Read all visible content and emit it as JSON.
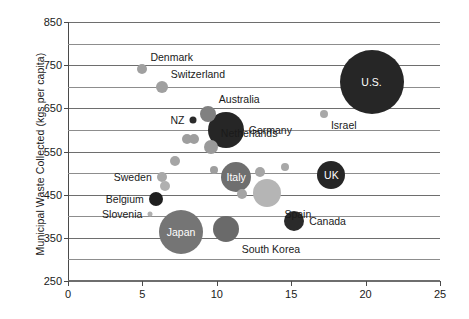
{
  "chart_data": {
    "type": "scatter",
    "title": "",
    "xlabel": "",
    "ylabel": "Municipal Waste Collected (kgs per capita)",
    "xlim": [
      0,
      25
    ],
    "ylim": [
      250,
      850
    ],
    "xticks": [
      0,
      5,
      10,
      15,
      20,
      25
    ],
    "yticks": [
      250,
      350,
      450,
      550,
      650,
      750,
      850
    ],
    "y_minor_step": 50,
    "grid": "horizontal",
    "legend": "none",
    "size_encoding": "bubble area (population / total waste)",
    "points": [
      {
        "label": "Denmark",
        "x": 5.0,
        "y": 740,
        "r": 5,
        "color": "#a0a0a0",
        "label_pos": "above-right",
        "label_inside": false
      },
      {
        "label": "Switzerland",
        "x": 6.3,
        "y": 700,
        "r": 6,
        "color": "#a0a0a0",
        "label_pos": "above-right",
        "label_inside": false
      },
      {
        "label": "Australia",
        "x": 9.4,
        "y": 637,
        "r": 8,
        "color": "#808080",
        "label_pos": "above-right",
        "label_inside": false
      },
      {
        "label": "NZ",
        "x": 8.4,
        "y": 622,
        "r": 3.5,
        "color": "#2a2a2a",
        "label_pos": "left",
        "label_inside": false
      },
      {
        "label": "Germany",
        "x": 10.6,
        "y": 600,
        "r": 18,
        "color": "#262626",
        "label_pos": "right",
        "label_inside": false
      },
      {
        "label": "Netherlands",
        "x": 9.6,
        "y": 560,
        "r": 7,
        "color": "#9a9a9a",
        "label_pos": "above-right",
        "label_inside": false
      },
      {
        "label": "Italy",
        "x": 11.3,
        "y": 492,
        "r": 15,
        "color": "#6f6f6f",
        "label_pos": "inside",
        "label_inside": true
      },
      {
        "label": "UK",
        "x": 17.7,
        "y": 495,
        "r": 14,
        "color": "#262626",
        "label_pos": "inside",
        "label_inside": true
      },
      {
        "label": "Sweden",
        "x": 6.3,
        "y": 492,
        "r": 5,
        "color": "#a8a8a8",
        "label_pos": "left",
        "label_inside": false
      },
      {
        "label": "Belgium",
        "x": 5.9,
        "y": 440,
        "r": 7,
        "color": "#1f1f1f",
        "label_pos": "left",
        "label_inside": false
      },
      {
        "label": "Slovenia",
        "x": 5.5,
        "y": 405,
        "r": 2.5,
        "color": "#b0b0b0",
        "label_pos": "left",
        "label_inside": false
      },
      {
        "label": "Spain",
        "x": 13.4,
        "y": 455,
        "r": 14,
        "color": "#b5b5b5",
        "label_pos": "below-right",
        "label_inside": false
      },
      {
        "label": "Canada",
        "x": 15.2,
        "y": 390,
        "r": 10,
        "color": "#2a2a2a",
        "label_pos": "right",
        "label_inside": false
      },
      {
        "label": "Japan",
        "x": 7.6,
        "y": 363,
        "r": 22,
        "color": "#757575",
        "label_pos": "inside",
        "label_inside": true
      },
      {
        "label": "South Korea",
        "x": 10.6,
        "y": 370,
        "r": 13,
        "color": "#6a6a6a",
        "label_pos": "below-right",
        "label_inside": false
      },
      {
        "label": "Israel",
        "x": 17.2,
        "y": 638,
        "r": 4,
        "color": "#a8a8a8",
        "label_pos": "below-right",
        "label_inside": false
      },
      {
        "label": "U.S.",
        "x": 20.4,
        "y": 712,
        "r": 32,
        "color": "#262626",
        "label_pos": "inside",
        "label_inside": true
      },
      {
        "label": "",
        "x": 8.0,
        "y": 578,
        "r": 5,
        "color": "#9e9e9e",
        "label_pos": "none",
        "label_inside": false
      },
      {
        "label": "",
        "x": 8.5,
        "y": 578,
        "r": 5,
        "color": "#9e9e9e",
        "label_pos": "none",
        "label_inside": false
      },
      {
        "label": "",
        "x": 7.2,
        "y": 528,
        "r": 5,
        "color": "#a5a5a5",
        "label_pos": "none",
        "label_inside": false
      },
      {
        "label": "",
        "x": 9.8,
        "y": 508,
        "r": 4,
        "color": "#9e9e9e",
        "label_pos": "none",
        "label_inside": false
      },
      {
        "label": "",
        "x": 12.9,
        "y": 502,
        "r": 5,
        "color": "#a5a5a5",
        "label_pos": "none",
        "label_inside": false
      },
      {
        "label": "",
        "x": 6.5,
        "y": 470,
        "r": 5,
        "color": "#b0b0b0",
        "label_pos": "none",
        "label_inside": false
      },
      {
        "label": "",
        "x": 11.7,
        "y": 452,
        "r": 5,
        "color": "#a5a5a5",
        "label_pos": "none",
        "label_inside": false
      },
      {
        "label": "",
        "x": 14.6,
        "y": 515,
        "r": 4,
        "color": "#a8a8a8",
        "label_pos": "none",
        "label_inside": false
      }
    ]
  }
}
